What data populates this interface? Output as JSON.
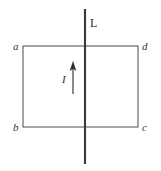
{
  "figure": {
    "kind": "physics-diagram",
    "width": 161,
    "height": 171,
    "background_color": "#ffffff",
    "stroke_color": "#3a3a3a",
    "loop_stroke_color": "#555555",
    "label_color": "#2b2b2b"
  },
  "labels": {
    "vertex_a": "a",
    "vertex_b": "b",
    "vertex_c": "c",
    "vertex_d": "d",
    "line": "L",
    "current": "I"
  },
  "geometry": {
    "rectangle": {
      "x": 23,
      "y": 46,
      "width": 115,
      "height": 81
    },
    "vertical_line": {
      "x": 85,
      "y1": 9,
      "y2": 164,
      "stroke_width": 2
    },
    "current_arrow": {
      "x": 73,
      "y_tail": 94,
      "y_head": 63,
      "stroke_width": 1
    }
  }
}
